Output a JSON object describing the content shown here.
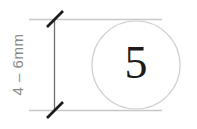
{
  "figure": {
    "background_color": "#ffffff",
    "width": 197,
    "height": 129
  },
  "dimension": {
    "label": "4 – 6mm",
    "orientation": "vertical",
    "text_color": "#8a8a8a",
    "line_color": "#5a5a5a",
    "extension_line_color": "#c8c8c8",
    "tick_style": "slash",
    "tick_color": "#1b1b1b",
    "line_x": 54,
    "line_top_y": 19,
    "line_bottom_y": 110,
    "extension_left_x": 29,
    "extension_right_x": 162
  },
  "circle": {
    "center_x": 136,
    "center_y": 65,
    "radius": 44,
    "stroke_color": "#cfcfcf",
    "fill_color": "#ffffff",
    "label": "5",
    "label_color": "#1b1b1b"
  }
}
